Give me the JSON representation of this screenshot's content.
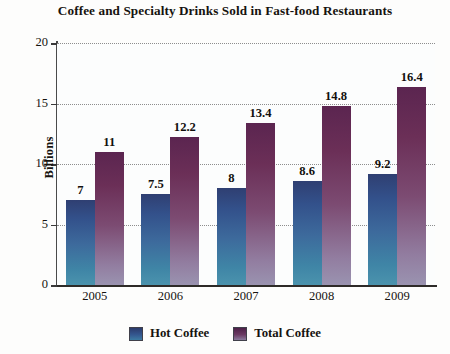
{
  "chart_data": {
    "type": "bar",
    "title": "Coffee and Specialty Drinks Sold in Fast-food Restaurants",
    "xlabel": "",
    "ylabel": "Billions",
    "categories": [
      "2005",
      "2006",
      "2007",
      "2008",
      "2009"
    ],
    "series": [
      {
        "name": "Hot Coffee",
        "color": "#3d6a9c",
        "values": [
          7,
          7.5,
          8,
          8.6,
          9.2
        ],
        "labels": [
          "7",
          "7.5",
          "8",
          "8.6",
          "9.2"
        ]
      },
      {
        "name": "Total Coffee",
        "color": "#7c4b72",
        "values": [
          11,
          12.2,
          13.4,
          14.8,
          16.4
        ],
        "labels": [
          "11",
          "12.2",
          "13.4",
          "14.8",
          "16.4"
        ]
      }
    ],
    "ylim": [
      0,
      20
    ],
    "yticks": [
      0,
      5,
      10,
      15,
      20
    ],
    "ytick_labels": [
      "0",
      "5",
      "10",
      "15",
      "20"
    ],
    "grid": true,
    "grid_style": "dotted-horizontal",
    "legend_position": "bottom-center"
  },
  "artifact": {
    "bleed_text": "Drinks Sold"
  }
}
